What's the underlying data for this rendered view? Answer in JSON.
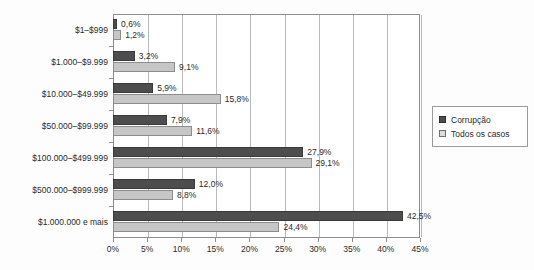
{
  "chart_data": {
    "type": "bar",
    "orientation": "horizontal",
    "title": "",
    "xlabel": "",
    "ylabel": "",
    "xlim": [
      0,
      45
    ],
    "xticks": [
      0,
      5,
      10,
      15,
      20,
      25,
      30,
      35,
      40,
      45
    ],
    "xtick_labels": [
      "0%",
      "5%",
      "10%",
      "15%",
      "20%",
      "25%",
      "30%",
      "35%",
      "40%",
      "45%"
    ],
    "grid": true,
    "grid_axis": "x",
    "legend_position": "right",
    "categories": [
      "$1–$999",
      "$1.000–$9.999",
      "$10.000–$49.999",
      "$50.000–$99.999",
      "$100.000–$499.999",
      "$500.000–$999.999",
      "$1.000.000 e mais"
    ],
    "series": [
      {
        "name": "Corrupção",
        "color": "#4d4d4d",
        "values": [
          0.6,
          3.2,
          5.9,
          7.9,
          27.9,
          12.0,
          42.5
        ],
        "labels": [
          "0,6%",
          "3,2%",
          "5,9%",
          "7,9%",
          "27,9%",
          "12,0%",
          "42,5%"
        ]
      },
      {
        "name": "Todos os casos",
        "color": "#c6c6c6",
        "values": [
          1.2,
          9.1,
          15.8,
          11.6,
          29.1,
          8.8,
          24.4
        ],
        "labels": [
          "1,2%",
          "9,1%",
          "15,8%",
          "11,6%",
          "29,1%",
          "8,8%",
          "24,4%"
        ]
      }
    ]
  },
  "legend": {
    "entries": [
      {
        "label": "Corrupção"
      },
      {
        "label": "Todos os casos"
      }
    ]
  }
}
